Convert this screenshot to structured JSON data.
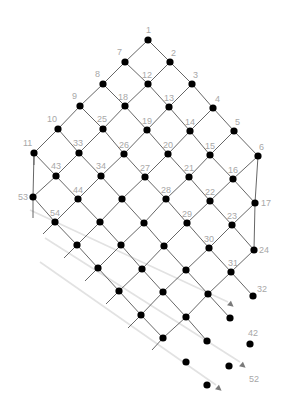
{
  "diagram": {
    "type": "lattice-grid",
    "colors": {
      "edge": "#555555",
      "node": "#000000",
      "label": "#a8a8a8",
      "guide": "#e2e2e2",
      "arrow": "#7a7a7a"
    },
    "nodes": [
      {
        "id": "n1",
        "x": 148,
        "y": 40,
        "label": "1",
        "lx": 146,
        "ly": 33
      },
      {
        "id": "n7",
        "x": 125,
        "y": 62,
        "label": "7",
        "lx": 117,
        "ly": 55
      },
      {
        "id": "n2",
        "x": 170,
        "y": 62,
        "label": "2",
        "lx": 171,
        "ly": 56
      },
      {
        "id": "n8",
        "x": 103,
        "y": 84,
        "label": "8",
        "lx": 95,
        "ly": 77
      },
      {
        "id": "n12",
        "x": 148,
        "y": 84,
        "label": "12",
        "lx": 142,
        "ly": 78
      },
      {
        "id": "n3",
        "x": 192,
        "y": 84,
        "label": "3",
        "lx": 193,
        "ly": 78
      },
      {
        "id": "n9",
        "x": 80,
        "y": 106,
        "label": "9",
        "lx": 72,
        "ly": 99
      },
      {
        "id": "n18",
        "x": 125,
        "y": 106,
        "label": "18",
        "lx": 118,
        "ly": 100
      },
      {
        "id": "n13",
        "x": 169,
        "y": 107,
        "label": "13",
        "lx": 164,
        "ly": 101
      },
      {
        "id": "n4",
        "x": 213,
        "y": 108,
        "label": "4",
        "lx": 215,
        "ly": 102
      },
      {
        "id": "n10",
        "x": 58,
        "y": 129,
        "label": "10",
        "lx": 47,
        "ly": 122
      },
      {
        "id": "n25",
        "x": 103,
        "y": 129,
        "label": "25",
        "lx": 97,
        "ly": 122
      },
      {
        "id": "n19",
        "x": 147,
        "y": 130,
        "label": "19",
        "lx": 142,
        "ly": 124
      },
      {
        "id": "n14",
        "x": 190,
        "y": 131,
        "label": "14",
        "lx": 185,
        "ly": 125
      },
      {
        "id": "n5",
        "x": 234,
        "y": 131,
        "label": "5",
        "lx": 235,
        "ly": 125
      },
      {
        "id": "n11",
        "x": 34,
        "y": 153,
        "label": "11",
        "lx": 23,
        "ly": 146
      },
      {
        "id": "n33",
        "x": 79,
        "y": 153,
        "label": "33",
        "lx": 73,
        "ly": 146
      },
      {
        "id": "n26",
        "x": 124,
        "y": 154,
        "label": "26",
        "lx": 119,
        "ly": 148
      },
      {
        "id": "n20",
        "x": 168,
        "y": 154,
        "label": "20",
        "lx": 163,
        "ly": 148
      },
      {
        "id": "n15",
        "x": 210,
        "y": 155,
        "label": "15",
        "lx": 205,
        "ly": 149
      },
      {
        "id": "n6",
        "x": 258,
        "y": 156,
        "label": "6",
        "lx": 259,
        "ly": 150
      },
      {
        "id": "n43",
        "x": 56,
        "y": 176,
        "label": "43",
        "lx": 51,
        "ly": 169
      },
      {
        "id": "n34",
        "x": 101,
        "y": 176,
        "label": "34",
        "lx": 96,
        "ly": 169
      },
      {
        "id": "n27",
        "x": 145,
        "y": 177,
        "label": "27",
        "lx": 140,
        "ly": 171
      },
      {
        "id": "n21",
        "x": 189,
        "y": 177,
        "label": "21",
        "lx": 184,
        "ly": 171
      },
      {
        "id": "n16",
        "x": 233,
        "y": 179,
        "label": "16",
        "lx": 228,
        "ly": 173
      },
      {
        "id": "n53",
        "x": 33,
        "y": 197,
        "label": "53",
        "lx": 18,
        "ly": 200
      },
      {
        "id": "n44",
        "x": 78,
        "y": 199,
        "label": "44",
        "lx": 73,
        "ly": 193
      },
      {
        "id": "r7c3",
        "x": 122,
        "y": 199,
        "label": ""
      },
      {
        "id": "n28",
        "x": 166,
        "y": 199,
        "label": "28",
        "lx": 161,
        "ly": 193
      },
      {
        "id": "n22",
        "x": 210,
        "y": 201,
        "label": "22",
        "lx": 205,
        "ly": 195
      },
      {
        "id": "n17",
        "x": 255,
        "y": 203,
        "label": "17",
        "lx": 261,
        "ly": 206
      },
      {
        "id": "n54",
        "x": 55,
        "y": 222,
        "label": "54",
        "lx": 50,
        "ly": 216
      },
      {
        "id": "r8c2",
        "x": 100,
        "y": 222,
        "label": ""
      },
      {
        "id": "r8c3",
        "x": 144,
        "y": 223,
        "label": ""
      },
      {
        "id": "n29",
        "x": 187,
        "y": 223,
        "label": "29",
        "lx": 182,
        "ly": 217
      },
      {
        "id": "n23",
        "x": 232,
        "y": 225,
        "label": "23",
        "lx": 227,
        "ly": 219
      },
      {
        "id": "r9c1",
        "x": 77,
        "y": 245,
        "label": ""
      },
      {
        "id": "r9c2",
        "x": 121,
        "y": 245,
        "label": ""
      },
      {
        "id": "r9c3",
        "x": 164,
        "y": 246,
        "label": ""
      },
      {
        "id": "n30",
        "x": 209,
        "y": 248,
        "label": "30",
        "lx": 204,
        "ly": 242
      },
      {
        "id": "n24",
        "x": 254,
        "y": 250,
        "label": "24",
        "lx": 259,
        "ly": 253
      },
      {
        "id": "r10c1",
        "x": 98,
        "y": 268,
        "label": ""
      },
      {
        "id": "r10c2",
        "x": 142,
        "y": 269,
        "label": ""
      },
      {
        "id": "r10c3",
        "x": 186,
        "y": 270,
        "label": ""
      },
      {
        "id": "n31",
        "x": 231,
        "y": 272,
        "label": "31",
        "lx": 228,
        "ly": 266
      },
      {
        "id": "r11c1",
        "x": 119,
        "y": 291,
        "label": ""
      },
      {
        "id": "r11c2",
        "x": 163,
        "y": 292,
        "label": ""
      },
      {
        "id": "r11c3",
        "x": 208,
        "y": 294,
        "label": ""
      },
      {
        "id": "n32",
        "x": 253,
        "y": 296,
        "label": "32",
        "lx": 257,
        "ly": 292
      },
      {
        "id": "r12c1",
        "x": 141,
        "y": 315,
        "label": ""
      },
      {
        "id": "r12c2",
        "x": 186,
        "y": 317,
        "label": ""
      },
      {
        "id": "r12c3",
        "x": 230,
        "y": 318,
        "label": ""
      },
      {
        "id": "r13c1",
        "x": 163,
        "y": 338,
        "label": ""
      },
      {
        "id": "r13c2",
        "x": 207,
        "y": 341,
        "label": ""
      },
      {
        "id": "n42",
        "x": 250,
        "y": 344,
        "label": "42",
        "lx": 248,
        "ly": 336
      },
      {
        "id": "r14c1",
        "x": 186,
        "y": 362,
        "label": ""
      },
      {
        "id": "r14c2",
        "x": 229,
        "y": 366,
        "label": ""
      },
      {
        "id": "r15c1",
        "x": 207,
        "y": 385,
        "label": ""
      },
      {
        "id": "lbl52",
        "x": -100,
        "y": -100,
        "label": "52",
        "lx": 249,
        "ly": 382,
        "hidden": true
      }
    ],
    "edges": [
      [
        "n1",
        "n7"
      ],
      [
        "n1",
        "n2"
      ],
      [
        "n7",
        "n8"
      ],
      [
        "n7",
        "n12"
      ],
      [
        "n2",
        "n12"
      ],
      [
        "n2",
        "n3"
      ],
      [
        "n8",
        "n9"
      ],
      [
        "n8",
        "n18"
      ],
      [
        "n12",
        "n18"
      ],
      [
        "n12",
        "n13"
      ],
      [
        "n3",
        "n13"
      ],
      [
        "n3",
        "n4"
      ],
      [
        "n9",
        "n10"
      ],
      [
        "n9",
        "n25"
      ],
      [
        "n18",
        "n25"
      ],
      [
        "n18",
        "n19"
      ],
      [
        "n13",
        "n19"
      ],
      [
        "n13",
        "n14"
      ],
      [
        "n4",
        "n14"
      ],
      [
        "n4",
        "n5"
      ],
      [
        "n10",
        "n11"
      ],
      [
        "n10",
        "n33"
      ],
      [
        "n25",
        "n33"
      ],
      [
        "n25",
        "n26"
      ],
      [
        "n19",
        "n26"
      ],
      [
        "n19",
        "n20"
      ],
      [
        "n14",
        "n20"
      ],
      [
        "n14",
        "n15"
      ],
      [
        "n5",
        "n15"
      ],
      [
        "n5",
        "n6"
      ],
      [
        "n11",
        "n43"
      ],
      [
        "n33",
        "n43"
      ],
      [
        "n33",
        "n34"
      ],
      [
        "n26",
        "n34"
      ],
      [
        "n26",
        "n27"
      ],
      [
        "n20",
        "n27"
      ],
      [
        "n20",
        "n21"
      ],
      [
        "n15",
        "n21"
      ],
      [
        "n15",
        "n16"
      ],
      [
        "n6",
        "n16"
      ],
      [
        "n11",
        "n53"
      ],
      [
        "n6",
        "n17"
      ],
      [
        "n43",
        "n53"
      ],
      [
        "n43",
        "n44"
      ],
      [
        "n34",
        "n44"
      ],
      [
        "n34",
        "r7c3"
      ],
      [
        "n27",
        "r7c3"
      ],
      [
        "n27",
        "n28"
      ],
      [
        "n21",
        "n28"
      ],
      [
        "n21",
        "n22"
      ],
      [
        "n16",
        "n22"
      ],
      [
        "n16",
        "n17"
      ],
      [
        "n53",
        "n54"
      ],
      [
        "n44",
        "n54"
      ],
      [
        "n44",
        "r8c2"
      ],
      [
        "r7c3",
        "r8c2"
      ],
      [
        "r7c3",
        "r8c3"
      ],
      [
        "n28",
        "r8c3"
      ],
      [
        "n28",
        "n29"
      ],
      [
        "n22",
        "n29"
      ],
      [
        "n22",
        "n23"
      ],
      [
        "n17",
        "n23"
      ],
      [
        "n17",
        "n24"
      ],
      [
        "n54",
        "r9c1"
      ],
      [
        "r8c2",
        "r9c1"
      ],
      [
        "r8c2",
        "r9c2"
      ],
      [
        "r8c3",
        "r9c2"
      ],
      [
        "r8c3",
        "r9c3"
      ],
      [
        "n29",
        "r9c3"
      ],
      [
        "n29",
        "n30"
      ],
      [
        "n23",
        "n30"
      ],
      [
        "n23",
        "n24"
      ],
      [
        "r9c1",
        "r10c1"
      ],
      [
        "r9c2",
        "r10c1"
      ],
      [
        "r9c2",
        "r10c2"
      ],
      [
        "r9c3",
        "r10c2"
      ],
      [
        "r9c3",
        "r10c3"
      ],
      [
        "n30",
        "r10c3"
      ],
      [
        "n30",
        "n31"
      ],
      [
        "n24",
        "n31"
      ],
      [
        "r10c1",
        "r11c1"
      ],
      [
        "r10c2",
        "r11c1"
      ],
      [
        "r10c2",
        "r11c2"
      ],
      [
        "r10c3",
        "r11c2"
      ],
      [
        "r10c3",
        "r11c3"
      ],
      [
        "n31",
        "r11c3"
      ],
      [
        "n31",
        "n32"
      ],
      [
        "r11c1",
        "r12c1"
      ],
      [
        "r11c2",
        "r12c1"
      ],
      [
        "r11c2",
        "r12c2"
      ],
      [
        "r11c3",
        "r12c2"
      ],
      [
        "r11c3",
        "r12c3"
      ],
      [
        "r12c1",
        "r13c1"
      ],
      [
        "r12c2",
        "r13c1"
      ],
      [
        "r12c2",
        "r13c2"
      ]
    ],
    "stubs": [
      [
        33,
        197,
        33,
        218
      ],
      [
        55,
        222,
        43,
        234
      ],
      [
        77,
        245,
        64,
        258
      ],
      [
        98,
        268,
        85,
        281
      ],
      [
        119,
        291,
        106,
        304
      ],
      [
        141,
        315,
        128,
        328
      ],
      [
        163,
        338,
        152,
        350
      ],
      [
        34,
        153,
        34,
        165
      ]
    ],
    "guides": [
      {
        "x1": 30,
        "y1": 210,
        "x2": 228,
        "y2": 302
      },
      {
        "x1": 45,
        "y1": 238,
        "x2": 240,
        "y2": 362
      },
      {
        "x1": 40,
        "y1": 262,
        "x2": 216,
        "y2": 385
      }
    ],
    "arrows": [
      {
        "x": 229,
        "y": 303,
        "angle": 40
      },
      {
        "x": 241,
        "y": 364,
        "angle": 40
      },
      {
        "x": 217,
        "y": 387,
        "angle": 40
      }
    ]
  }
}
